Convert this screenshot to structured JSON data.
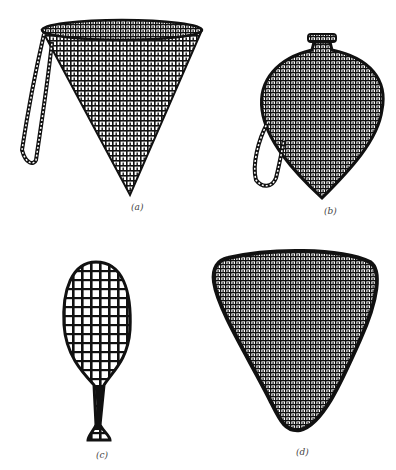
{
  "figure": {
    "panels": [
      {
        "id": "a",
        "label": "(a)",
        "description": "conical coiled basket with loop strap"
      },
      {
        "id": "b",
        "label": "(b)",
        "description": "bottle-shaped coiled basket with narrow neck and loop strap"
      },
      {
        "id": "c",
        "label": "(c)",
        "description": "open-weave spoon-shaped basket with handle"
      },
      {
        "id": "d",
        "label": "(d)",
        "description": "rounded triangular coiled basket"
      }
    ],
    "colors": {
      "ink": "#111111",
      "paper": "#ffffff"
    }
  }
}
